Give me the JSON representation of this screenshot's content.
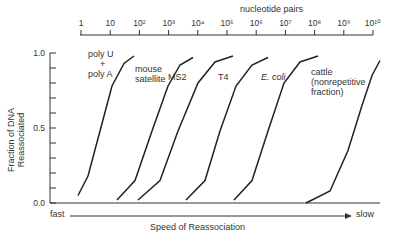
{
  "chart_data": {
    "type": "line",
    "title": "",
    "top_axis": {
      "label": "nucleotide pairs",
      "ticks": [
        "1",
        "10",
        "10²",
        "10³",
        "10⁴",
        "10⁵",
        "10⁶",
        "10⁷",
        "10⁸",
        "10⁹",
        "10¹⁰"
      ]
    },
    "ylabel": "Fraction of DNA Reassociated",
    "yticks": [
      "0.0",
      "0.5",
      "1.0"
    ],
    "ylim": [
      0,
      1
    ],
    "xlabel": "Speed of Reassociation",
    "x_left": "fast",
    "x_right": "slow",
    "series": [
      {
        "name": "poly U + poly A",
        "label_lines": [
          "poly U",
          "+",
          "poly A"
        ],
        "x": [
          78,
          88,
          100,
          112,
          124,
          134
        ],
        "y": [
          0.05,
          0.18,
          0.48,
          0.78,
          0.93,
          0.98
        ]
      },
      {
        "name": "mouse satellite",
        "label_lines": [
          "mouse",
          "satellite"
        ],
        "x": [
          117,
          135,
          152,
          168,
          180,
          193
        ],
        "y": [
          0.02,
          0.15,
          0.48,
          0.78,
          0.92,
          0.97
        ]
      },
      {
        "name": "MS2",
        "label_lines": [
          "MS2"
        ],
        "x": [
          138,
          160,
          178,
          198,
          215,
          233
        ],
        "y": [
          0.02,
          0.15,
          0.48,
          0.8,
          0.94,
          0.98
        ]
      },
      {
        "name": "T4",
        "label_lines": [
          "T4"
        ],
        "x": [
          186,
          205,
          220,
          236,
          252,
          268
        ],
        "y": [
          0.02,
          0.15,
          0.48,
          0.78,
          0.92,
          0.97
        ]
      },
      {
        "name": "E. coli",
        "label_lines": [
          "E. coli"
        ],
        "x": [
          234,
          252,
          268,
          284,
          300,
          318
        ],
        "y": [
          0.02,
          0.15,
          0.48,
          0.8,
          0.94,
          0.98
        ]
      },
      {
        "name": "cattle (nonrepetitive fraction)",
        "label_lines": [
          "cattle",
          "(nonrepetitive",
          "fraction)"
        ],
        "x": [
          306,
          330,
          348,
          362,
          372,
          380
        ],
        "y": [
          0.0,
          0.08,
          0.35,
          0.65,
          0.85,
          0.95
        ]
      }
    ]
  }
}
